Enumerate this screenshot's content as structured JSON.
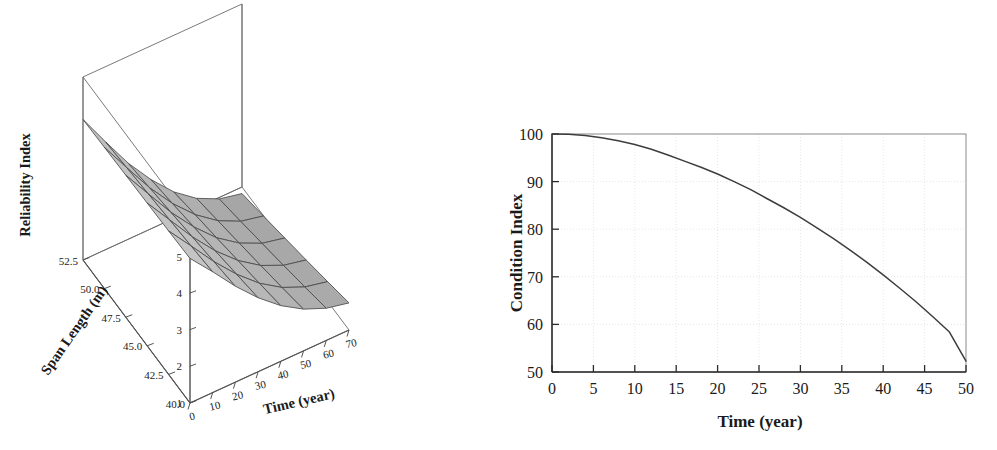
{
  "figure": {
    "background": "#ffffff",
    "panels": [
      "surface-plot",
      "line-plot"
    ]
  },
  "chart_data": [
    {
      "id": "reliability-surface",
      "type": "surface",
      "title": "",
      "xlabel": "Time (year)",
      "ylabel": "Span Length (m)",
      "zlabel": "Reliability Index",
      "xlim": [
        0,
        70
      ],
      "ylim": [
        40.0,
        52.5
      ],
      "zlim": [
        1,
        6
      ],
      "xticks": [
        0,
        10,
        20,
        30,
        40,
        50,
        60,
        70
      ],
      "xtick_labels": [
        "0",
        "10",
        "20",
        "30",
        "40",
        "50",
        "60",
        "70"
      ],
      "yticks": [
        52.5,
        50.0,
        47.5,
        45.0,
        42.5,
        40.0
      ],
      "ytick_labels": [
        "52.5",
        "50.0",
        "47.5",
        "45.0",
        "42.5",
        "40.0"
      ],
      "zticks": [
        1,
        2,
        3,
        4,
        5,
        6
      ],
      "ztick_labels": [
        "1",
        "2",
        "3",
        "4",
        "5",
        "6"
      ],
      "grid": false,
      "surface_color": "#b9b9b9",
      "mesh_color": "#4a4a4a",
      "x": [
        0,
        10,
        20,
        30,
        40,
        50,
        60,
        70
      ],
      "y": [
        40.0,
        42.5,
        45.0,
        47.5,
        50.0,
        52.5
      ],
      "z": [
        [
          4.95,
          4.3,
          3.62,
          3.02,
          2.52,
          2.14,
          1.88,
          1.74
        ],
        [
          4.92,
          4.22,
          3.51,
          2.88,
          2.35,
          1.95,
          1.68,
          1.54
        ],
        [
          4.9,
          4.15,
          3.4,
          2.74,
          2.19,
          1.77,
          1.49,
          1.35
        ],
        [
          4.88,
          4.08,
          3.29,
          2.61,
          2.03,
          1.6,
          1.31,
          1.17
        ],
        [
          4.86,
          4.01,
          3.18,
          2.47,
          1.88,
          1.43,
          1.13,
          0.99
        ],
        [
          4.84,
          3.94,
          3.07,
          2.34,
          1.72,
          1.26,
          0.96,
          0.82
        ]
      ],
      "note": "Reliability index decreases with time and with increasing span length"
    },
    {
      "id": "condition-index-line",
      "type": "line",
      "title": "",
      "xlabel": "Time (year)",
      "ylabel": "Condition Index",
      "xlim": [
        0,
        50
      ],
      "ylim": [
        50,
        100
      ],
      "xticks": [
        0,
        5,
        10,
        15,
        20,
        25,
        30,
        35,
        40,
        45,
        50
      ],
      "xtick_labels": [
        "0",
        "5",
        "10",
        "15",
        "20",
        "25",
        "30",
        "35",
        "40",
        "45",
        "50"
      ],
      "yticks": [
        50,
        60,
        70,
        80,
        90,
        100
      ],
      "ytick_labels": [
        "50",
        "60",
        "70",
        "80",
        "90",
        "100"
      ],
      "grid": true,
      "grid_color": "#dcdcdc",
      "line_color": "#3d3d3d",
      "x": [
        0,
        2,
        4,
        6,
        8,
        10,
        12,
        14,
        16,
        18,
        20,
        22,
        24,
        26,
        28,
        30,
        32,
        34,
        36,
        38,
        40,
        42,
        44,
        46,
        48,
        50
      ],
      "values": [
        100.0,
        99.95,
        99.7,
        99.2,
        98.6,
        97.8,
        96.8,
        95.6,
        94.3,
        93.0,
        91.6,
        90.0,
        88.3,
        86.4,
        84.5,
        82.5,
        80.3,
        78.0,
        75.6,
        73.1,
        70.4,
        67.6,
        64.7,
        61.6,
        58.4,
        52.3
      ]
    }
  ],
  "surface_plot": {
    "z_axis_title": "Reliability Index",
    "y_axis_title": "Span Length (m)",
    "x_axis_title": "Time (year)",
    "z_ticks": [
      "6",
      "5",
      "4",
      "3",
      "2",
      "1"
    ],
    "y_ticks": [
      "52.5",
      "50.0",
      "47.5",
      "45.0",
      "42.5",
      "40.0"
    ],
    "x_ticks": [
      "0",
      "10",
      "20",
      "30",
      "40",
      "50",
      "60",
      "70"
    ]
  },
  "line_plot": {
    "y_axis_title": "Condition Index",
    "x_axis_title": "Time (year)",
    "y_ticks": [
      "100",
      "90",
      "80",
      "70",
      "60",
      "50"
    ],
    "x_ticks": [
      "0",
      "5",
      "10",
      "15",
      "20",
      "25",
      "30",
      "35",
      "40",
      "45",
      "50"
    ]
  },
  "colors": {
    "ink": "#1a1a1a",
    "axis": "#555555",
    "grid": "#dcdcdc",
    "surface_fill": "#b9b9b9",
    "surface_edge": "#4a4a4a",
    "line": "#3d3d3d"
  }
}
